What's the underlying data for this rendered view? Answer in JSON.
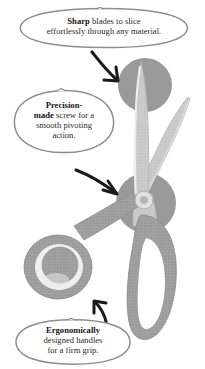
{
  "page": {
    "background_color": "#ffffff"
  },
  "illustration": {
    "subject": "scissors",
    "style": "grayscale halftone line drawing with hand-drawn callouts",
    "colors": {
      "blade_fill": "#c9c9c9",
      "blade_edge": "#b0b0b0",
      "handle_fill": "#9c9c9c",
      "handle_inner": "#ededed",
      "highlight_circle": "#9a9a9a",
      "arrow": "#1a1a1a",
      "bubble_outline": "#8e8e8e",
      "text": "#2b2b2b"
    },
    "parts": [
      {
        "name": "upper-blade",
        "label": "blade"
      },
      {
        "name": "lower-blade",
        "label": "blade"
      },
      {
        "name": "pivot-screw",
        "label": "screw"
      },
      {
        "name": "left-handle",
        "label": "handle"
      },
      {
        "name": "right-handle",
        "label": "handle"
      }
    ],
    "highlight_circles": [
      {
        "name": "blade-tip-highlight",
        "target": "blade tip"
      },
      {
        "name": "pivot-highlight",
        "target": "pivot screw"
      },
      {
        "name": "handle-highlight",
        "target": "left handle"
      }
    ]
  },
  "callouts": [
    {
      "id": "sharp",
      "emphasis": "Sharp",
      "rest": " blades to slice effortlessly through any material.",
      "line1_bold": "Sharp",
      "line1_rest": " blades to slice",
      "line2": "effortlessly through any material.",
      "points_to": "blade tip"
    },
    {
      "id": "precision",
      "emphasis": "Precision-made",
      "rest": " screw for a smooth pivoting action.",
      "line1_bold": "Precision-",
      "line2_bold": "made",
      "line2_rest": " screw for a",
      "line3": "smooth pivoting",
      "line4": "action.",
      "points_to": "pivot screw"
    },
    {
      "id": "ergonomic",
      "emphasis": "Ergonomically",
      "rest": " designed handles for a firm grip.",
      "line1_bold": "Ergonomically",
      "line2": "designed handles",
      "line3": "for a firm grip.",
      "points_to": "left handle"
    }
  ],
  "arrows": [
    {
      "name": "arrow-to-blade-tip",
      "from": "sharp callout",
      "to": "blade tip"
    },
    {
      "name": "arrow-to-pivot",
      "from": "precision callout",
      "to": "pivot screw"
    },
    {
      "name": "arrow-to-handle",
      "from": "ergonomic callout",
      "to": "left handle"
    }
  ]
}
